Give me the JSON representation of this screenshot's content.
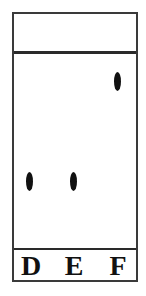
{
  "diagram": {
    "type": "thin-layer-chromatography-plate",
    "lanes": [
      {
        "label": "D",
        "spot": {
          "x": 15,
          "y": 160
        }
      },
      {
        "label": "E",
        "spot": {
          "x": 59,
          "y": 160
        }
      },
      {
        "label": "F",
        "spot": {
          "x": 103,
          "y": 60
        }
      }
    ],
    "colors": {
      "border": "#3a3a3a",
      "spot": "#111111",
      "background": "#ffffff"
    }
  }
}
